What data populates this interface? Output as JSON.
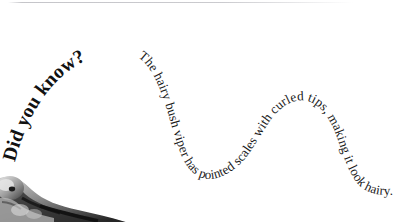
{
  "card": {
    "background_color": "#ffffff",
    "width": 416,
    "height": 222
  },
  "top_rule": {
    "name": "divider-line",
    "color": "#96969e"
  },
  "fact": {
    "lead_label": "Did you know?",
    "body_text": "The hairy bush viper has pointed scales with curled tips, making it look hairy.",
    "full_text": "Did you know? The hairy bush viper has pointed scales with curled tips, making it look hairy.",
    "lead_color": "#111111",
    "body_color": "#1a1a1a",
    "layout": "text-on-wave-path"
  },
  "photo": {
    "name": "snake-photo-fragment",
    "description": "grayscale snake head crop",
    "palette": {
      "dark": "#1b1b1b",
      "mid": "#6e6e6e",
      "light": "#d6d6d6",
      "highlight": "#f2f2f2"
    }
  }
}
